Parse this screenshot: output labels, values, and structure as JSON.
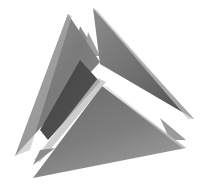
{
  "image": {
    "subject": "intersecting triangular planes sculpture",
    "background": "#ffffff",
    "colors": {
      "dark": "#3a3a3a",
      "mid": "#6e6e6e",
      "light": "#a8a8a8",
      "highlight": "#d8d8d8"
    }
  }
}
